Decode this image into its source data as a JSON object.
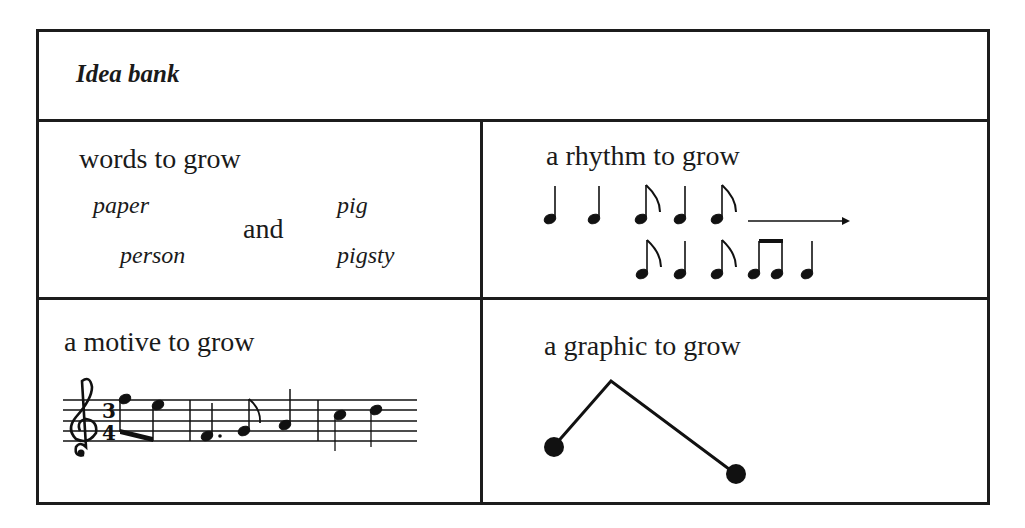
{
  "title": "Idea bank",
  "cells": {
    "words": {
      "heading": "words to grow",
      "left_words": [
        "paper",
        "person"
      ],
      "connector": "and",
      "right_words": [
        "pig",
        "pigsty"
      ]
    },
    "rhythm": {
      "heading": "a rhythm to grow",
      "row1": [
        "quarter",
        "quarter",
        "eighth",
        "quarter",
        "eighth"
      ],
      "row1_arrow": true,
      "row2": [
        "eighth",
        "quarter",
        "eighth",
        "beamed-eighth",
        "beamed-eighth",
        "quarter"
      ]
    },
    "motive": {
      "heading": "a motive to grow",
      "clef": "treble",
      "time_signature": "3/4",
      "measures": [
        [
          "E5 eighth",
          "D5 eighth"
        ],
        [
          "F4 dotted-quarter",
          "G4 eighth",
          "A4 quarter"
        ],
        [
          "B4 quarter",
          "C5 quarter"
        ]
      ]
    },
    "graphic": {
      "heading": "a graphic to grow",
      "shape": "two-dots-joined-by-peaked-line"
    }
  }
}
